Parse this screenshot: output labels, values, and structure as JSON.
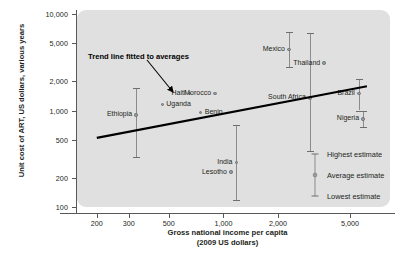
{
  "chart_data": {
    "type": "scatter",
    "title": "",
    "xlabel": "Gross national income per capita",
    "xlabel_sub": "(2009 US dollars)",
    "ylabel": "Unit cost of ART, US dollars, various years",
    "xscale": "log",
    "yscale": "log",
    "xlim": [
      170,
      8000
    ],
    "ylim": [
      100,
      10000
    ],
    "grid": false,
    "xticks": [
      "200",
      "300",
      "500",
      "1,000",
      "2,000",
      "5,000"
    ],
    "xtick_values": [
      200,
      300,
      500,
      1000,
      2000,
      5000
    ],
    "yticks": [
      "100",
      "200",
      "500",
      "1,000",
      "2,000",
      "5,000",
      "10,000"
    ],
    "ytick_values": [
      100,
      200,
      500,
      1000,
      2000,
      5000,
      10000
    ],
    "annotation": "Trend line fitted to averages",
    "series_name": "Unit cost of ART by country",
    "points": [
      {
        "country": "Ethiopia",
        "gni": 330,
        "average": 900,
        "highest": 1700,
        "lowest": 330,
        "label_side": "left"
      },
      {
        "country": "Uganda",
        "gni": 460,
        "average": 1150,
        "highest": null,
        "lowest": null,
        "label_side": "right"
      },
      {
        "country": "Haiti",
        "gni": 650,
        "average": 1500,
        "highest": null,
        "lowest": null,
        "label_side": "left"
      },
      {
        "country": "Benin",
        "gni": 750,
        "average": 950,
        "highest": null,
        "lowest": null,
        "label_side": "right"
      },
      {
        "country": "Morocco",
        "gni": 900,
        "average": 1500,
        "highest": null,
        "lowest": null,
        "label_side": "left"
      },
      {
        "country": "Lesotho",
        "gni": 1100,
        "average": 230,
        "highest": null,
        "lowest": null,
        "label_side": "left"
      },
      {
        "country": "India",
        "gni": 1180,
        "average": 290,
        "highest": 700,
        "lowest": 118,
        "label_side": "left"
      },
      {
        "country": "Mexico",
        "gni": 2300,
        "average": 4300,
        "highest": 6500,
        "lowest": 2800,
        "label_side": "left"
      },
      {
        "country": "South Africa",
        "gni": 3000,
        "average": 1350,
        "highest": 6300,
        "lowest": 380,
        "label_side": "left"
      },
      {
        "country": "Thailand",
        "gni": 3600,
        "average": 3100,
        "highest": null,
        "lowest": null,
        "label_side": "left"
      },
      {
        "country": "Brazil",
        "gni": 5600,
        "average": 1500,
        "highest": 2100,
        "lowest": 1000,
        "label_side": "left"
      },
      {
        "country": "Nigeria",
        "gni": 5900,
        "average": 820,
        "highest": 1000,
        "lowest": 680,
        "label_side": "left"
      }
    ],
    "trend_line": {
      "x_start": 200,
      "y_start": 520,
      "x_end": 6200,
      "y_end": 1780
    }
  },
  "legend": {
    "position": "inside-bottom-right",
    "items": [
      {
        "key": "highest",
        "label": "Highest estimate"
      },
      {
        "key": "average",
        "label": "Average estimate"
      },
      {
        "key": "lowest",
        "label": "Lowest estimate"
      }
    ]
  },
  "colors": {
    "panel": "#e0e0e0",
    "axis": "#58585a",
    "marker": "#9a9a9c",
    "errorbar": "#8b8b8d",
    "trend": "#000000",
    "text": "#231f20"
  }
}
